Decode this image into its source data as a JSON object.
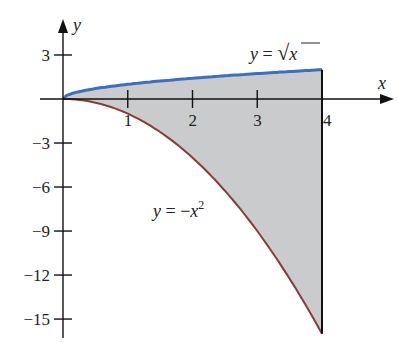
{
  "chart_data": {
    "type": "area",
    "title": "",
    "xlabel": "x",
    "ylabel": "y",
    "xlim": [
      0,
      4
    ],
    "ylim": [
      -16,
      3
    ],
    "grid": false,
    "x_ticks": [
      1,
      2,
      3,
      4
    ],
    "x_tick_labels": [
      "1",
      "2",
      "3",
      "4"
    ],
    "y_ticks": [
      3,
      -3,
      -6,
      -9,
      -12,
      -15
    ],
    "y_tick_labels": [
      "3",
      "−3",
      "−6",
      "−9",
      "−12",
      "−15"
    ],
    "series": [
      {
        "name": "y = √x",
        "function": "sqrt(x)",
        "color": "#3a6fc4",
        "x": [
          0,
          0.25,
          0.5,
          1,
          1.5,
          2,
          2.5,
          3,
          3.5,
          4
        ],
        "values": [
          0,
          0.5,
          0.71,
          1,
          1.22,
          1.41,
          1.58,
          1.73,
          1.87,
          2
        ]
      },
      {
        "name": "y = −x²",
        "function": "-x^2",
        "color": "#8b3a3a",
        "x": [
          0,
          0.5,
          1,
          1.5,
          2,
          2.5,
          3,
          3.5,
          4
        ],
        "values": [
          0,
          -0.25,
          -1,
          -2.25,
          -4,
          -6.25,
          -9,
          -12.25,
          -16
        ]
      }
    ],
    "shaded_region": {
      "between": [
        "y = √x",
        "y = −x²"
      ],
      "x_range": [
        0,
        4
      ],
      "fill_color": "#c9cbcc",
      "right_boundary": "x = 4"
    },
    "annotations": [
      {
        "text_prefix": "y",
        "text_eq": " = ",
        "text_main": "√",
        "text_var": "x",
        "label": "y = √x"
      },
      {
        "text_prefix": "y",
        "text_eq": " = −",
        "text_var": "x",
        "text_sup": "2",
        "label": "y = −x²"
      }
    ]
  }
}
